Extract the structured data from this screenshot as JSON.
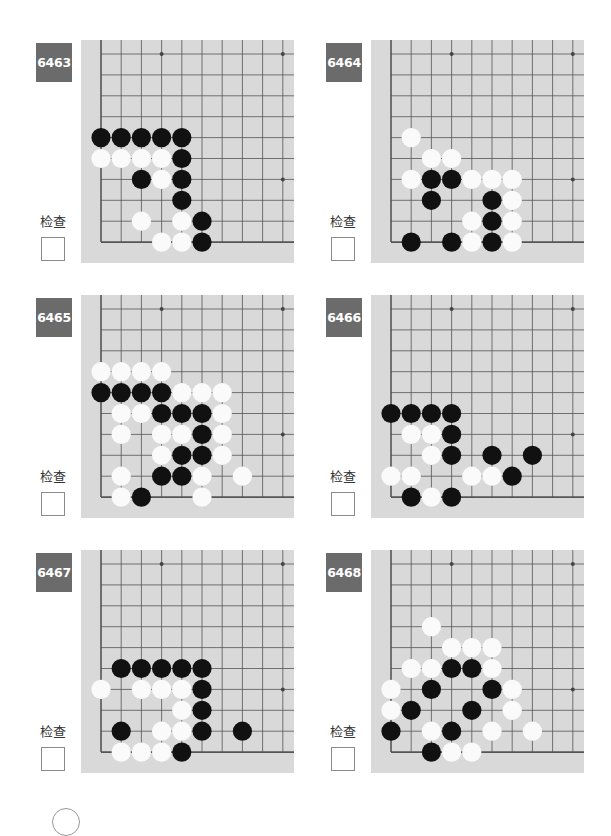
{
  "check_label": "检查",
  "colors": {
    "board": "#d9d9d9",
    "badge": "#6b6b6b",
    "black_stone": "#111111",
    "white_stone": "#fafafa",
    "grid": "#555555"
  },
  "problems": [
    {
      "number": "6463",
      "stones": {
        "black": [
          [
            0,
            4
          ],
          [
            1,
            4
          ],
          [
            2,
            4
          ],
          [
            3,
            4
          ],
          [
            4,
            4
          ],
          [
            4,
            5
          ],
          [
            2,
            6
          ],
          [
            4,
            6
          ],
          [
            4,
            7
          ],
          [
            5,
            8
          ],
          [
            5,
            9
          ]
        ],
        "white": [
          [
            0,
            5
          ],
          [
            1,
            5
          ],
          [
            2,
            5
          ],
          [
            3,
            5
          ],
          [
            3,
            6
          ],
          [
            2,
            8
          ],
          [
            4,
            8
          ],
          [
            3,
            9
          ],
          [
            4,
            9
          ]
        ]
      }
    },
    {
      "number": "6464",
      "stones": {
        "black": [
          [
            2,
            6
          ],
          [
            3,
            6
          ],
          [
            2,
            7
          ],
          [
            5,
            7
          ],
          [
            5,
            8
          ],
          [
            1,
            9
          ],
          [
            3,
            9
          ],
          [
            5,
            9
          ]
        ],
        "white": [
          [
            1,
            4
          ],
          [
            2,
            5
          ],
          [
            3,
            5
          ],
          [
            1,
            6
          ],
          [
            4,
            6
          ],
          [
            5,
            6
          ],
          [
            6,
            6
          ],
          [
            6,
            7
          ],
          [
            4,
            8
          ],
          [
            6,
            8
          ],
          [
            4,
            9
          ],
          [
            6,
            9
          ]
        ]
      }
    },
    {
      "number": "6465",
      "stones": {
        "black": [
          [
            0,
            4
          ],
          [
            1,
            4
          ],
          [
            2,
            4
          ],
          [
            3,
            4
          ],
          [
            3,
            5
          ],
          [
            4,
            5
          ],
          [
            5,
            5
          ],
          [
            5,
            6
          ],
          [
            4,
            7
          ],
          [
            5,
            7
          ],
          [
            3,
            8
          ],
          [
            4,
            8
          ],
          [
            2,
            9
          ]
        ],
        "white": [
          [
            0,
            3
          ],
          [
            1,
            3
          ],
          [
            2,
            3
          ],
          [
            3,
            3
          ],
          [
            4,
            4
          ],
          [
            5,
            4
          ],
          [
            6,
            4
          ],
          [
            1,
            5
          ],
          [
            2,
            5
          ],
          [
            6,
            5
          ],
          [
            1,
            6
          ],
          [
            3,
            6
          ],
          [
            4,
            6
          ],
          [
            6,
            6
          ],
          [
            3,
            7
          ],
          [
            6,
            7
          ],
          [
            1,
            8
          ],
          [
            5,
            8
          ],
          [
            7,
            8
          ],
          [
            1,
            9
          ],
          [
            5,
            9
          ]
        ]
      }
    },
    {
      "number": "6466",
      "stones": {
        "black": [
          [
            0,
            5
          ],
          [
            1,
            5
          ],
          [
            2,
            5
          ],
          [
            3,
            5
          ],
          [
            3,
            6
          ],
          [
            3,
            7
          ],
          [
            5,
            7
          ],
          [
            7,
            7
          ],
          [
            6,
            8
          ],
          [
            1,
            9
          ],
          [
            3,
            9
          ]
        ],
        "white": [
          [
            1,
            6
          ],
          [
            2,
            6
          ],
          [
            2,
            7
          ],
          [
            0,
            8
          ],
          [
            1,
            8
          ],
          [
            4,
            8
          ],
          [
            5,
            8
          ],
          [
            2,
            9
          ]
        ]
      }
    },
    {
      "number": "6467",
      "stones": {
        "black": [
          [
            1,
            5
          ],
          [
            2,
            5
          ],
          [
            3,
            5
          ],
          [
            4,
            5
          ],
          [
            5,
            5
          ],
          [
            5,
            6
          ],
          [
            5,
            7
          ],
          [
            1,
            8
          ],
          [
            5,
            8
          ],
          [
            7,
            8
          ],
          [
            4,
            9
          ]
        ],
        "white": [
          [
            0,
            6
          ],
          [
            2,
            6
          ],
          [
            3,
            6
          ],
          [
            4,
            6
          ],
          [
            4,
            7
          ],
          [
            3,
            8
          ],
          [
            4,
            8
          ],
          [
            1,
            9
          ],
          [
            2,
            9
          ],
          [
            3,
            9
          ]
        ]
      }
    },
    {
      "number": "6468",
      "stones": {
        "black": [
          [
            3,
            5
          ],
          [
            4,
            5
          ],
          [
            2,
            6
          ],
          [
            5,
            6
          ],
          [
            1,
            7
          ],
          [
            4,
            7
          ],
          [
            0,
            8
          ],
          [
            3,
            8
          ],
          [
            2,
            9
          ]
        ],
        "white": [
          [
            2,
            3
          ],
          [
            3,
            4
          ],
          [
            4,
            4
          ],
          [
            5,
            4
          ],
          [
            1,
            5
          ],
          [
            2,
            5
          ],
          [
            5,
            5
          ],
          [
            0,
            6
          ],
          [
            6,
            6
          ],
          [
            0,
            7
          ],
          [
            6,
            7
          ],
          [
            2,
            8
          ],
          [
            5,
            8
          ],
          [
            7,
            8
          ],
          [
            3,
            9
          ],
          [
            4,
            9
          ]
        ]
      }
    }
  ]
}
